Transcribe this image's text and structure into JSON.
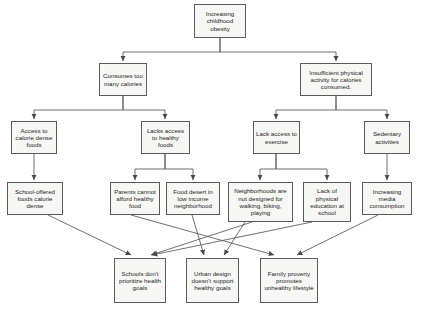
{
  "diagram": {
    "title_text": "Increasing childhood obesity",
    "type": "cause-and-effect flowchart",
    "style": {
      "node_fill": "#f7f7f5",
      "node_border": "#5a5a5a",
      "connector_color": "#555555",
      "text_color": "#1c1c1c",
      "page_background": "#ffffff"
    },
    "nodes": [
      {
        "id": "root",
        "label": "Increasing childhood obesity",
        "level": 1,
        "x": 194,
        "y": 4,
        "w": 52,
        "h": 34,
        "font": 6.2
      },
      {
        "id": "calories",
        "label": "Consumes too many calories",
        "level": 2,
        "x": 99,
        "y": 63,
        "w": 48,
        "h": 33,
        "font": 6.2
      },
      {
        "id": "inactivity",
        "label": "Insufficient physical activity for calories consumed.",
        "level": 2,
        "x": 300,
        "y": 63,
        "w": 72,
        "h": 33,
        "font": 6.2
      },
      {
        "id": "access-dense",
        "label": "Access to calorie dense foods",
        "level": 3,
        "x": 11,
        "y": 121,
        "w": 46,
        "h": 33,
        "font": 6.2
      },
      {
        "id": "lacks-access",
        "label": "Lacks access to healthy foods",
        "level": 3,
        "x": 141,
        "y": 121,
        "w": 49,
        "h": 33,
        "font": 6.2
      },
      {
        "id": "lack-exercise",
        "label": "Lack access to exercise",
        "level": 3,
        "x": 253,
        "y": 121,
        "w": 47,
        "h": 33,
        "font": 6.2
      },
      {
        "id": "sedentary",
        "label": "Sedentary activities",
        "level": 3,
        "x": 364,
        "y": 121,
        "w": 46,
        "h": 33,
        "font": 6.2
      },
      {
        "id": "school-foods",
        "label": "School-offered foods calorie dense",
        "level": 4,
        "x": 7,
        "y": 182,
        "w": 56,
        "h": 33,
        "font": 6.2
      },
      {
        "id": "parents",
        "label": "Parents cannot afford healthy food",
        "level": 4,
        "x": 110,
        "y": 182,
        "w": 50,
        "h": 33,
        "font": 6.2
      },
      {
        "id": "food-desert",
        "label": "Food desert in low income neighborhood",
        "level": 4,
        "x": 166,
        "y": 182,
        "w": 54,
        "h": 33,
        "font": 6.2
      },
      {
        "id": "neighborhoods",
        "label": "Neighborhoods are not designed for walking, biking, playing",
        "level": 4,
        "x": 228,
        "y": 182,
        "w": 65,
        "h": 40,
        "font": 6.2
      },
      {
        "id": "no-pe",
        "label": "Lack of physical education at school",
        "level": 4,
        "x": 303,
        "y": 182,
        "w": 48,
        "h": 40,
        "font": 6.2
      },
      {
        "id": "media",
        "label": "Increasing media consumption",
        "level": 4,
        "x": 362,
        "y": 182,
        "w": 50,
        "h": 33,
        "font": 6.2
      },
      {
        "id": "schools-goals",
        "label": "Schools don't prioritize health goals",
        "level": 5,
        "x": 114,
        "y": 258,
        "w": 52,
        "h": 45,
        "font": 6.2
      },
      {
        "id": "urban-design",
        "label": "Urban design doesn't support healthy goals",
        "level": 5,
        "x": 186,
        "y": 258,
        "w": 53,
        "h": 45,
        "font": 6.2
      },
      {
        "id": "poverty",
        "label": "Family proverty promotes unhealthy lifestyle",
        "level": 5,
        "x": 260,
        "y": 258,
        "w": 58,
        "h": 45,
        "font": 6.2
      }
    ],
    "edges": [
      {
        "from": "root",
        "to": "calories",
        "style": "orthogonal"
      },
      {
        "from": "root",
        "to": "inactivity",
        "style": "orthogonal"
      },
      {
        "from": "calories",
        "to": "access-dense",
        "style": "orthogonal"
      },
      {
        "from": "calories",
        "to": "lacks-access",
        "style": "orthogonal"
      },
      {
        "from": "inactivity",
        "to": "lack-exercise",
        "style": "orthogonal"
      },
      {
        "from": "inactivity",
        "to": "sedentary",
        "style": "orthogonal"
      },
      {
        "from": "access-dense",
        "to": "school-foods",
        "style": "straight"
      },
      {
        "from": "lacks-access",
        "to": "parents",
        "style": "orthogonal"
      },
      {
        "from": "lacks-access",
        "to": "food-desert",
        "style": "orthogonal"
      },
      {
        "from": "lack-exercise",
        "to": "neighborhoods",
        "style": "orthogonal"
      },
      {
        "from": "lack-exercise",
        "to": "no-pe",
        "style": "orthogonal"
      },
      {
        "from": "sedentary",
        "to": "media",
        "style": "straight"
      },
      {
        "from": "school-foods",
        "to": "schools-goals",
        "style": "diagonal"
      },
      {
        "from": "parents",
        "to": "poverty",
        "style": "diagonal"
      },
      {
        "from": "food-desert",
        "to": "urban-design",
        "style": "diagonal"
      },
      {
        "from": "neighborhoods",
        "to": "urban-design",
        "style": "diagonal"
      },
      {
        "from": "neighborhoods",
        "to": "schools-goals",
        "style": "diagonal"
      },
      {
        "from": "no-pe",
        "to": "schools-goals",
        "style": "diagonal"
      },
      {
        "from": "media",
        "to": "poverty",
        "style": "diagonal"
      }
    ]
  }
}
